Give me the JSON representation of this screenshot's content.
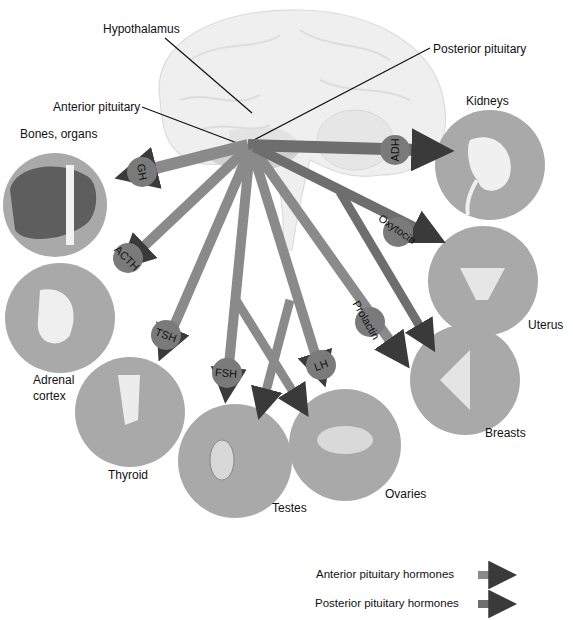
{
  "diagram": {
    "structures": {
      "hypothalamus": "Hypothalamus",
      "anterior_pituitary": "Anterior pituitary",
      "posterior_pituitary": "Posterior pituitary"
    },
    "targets": {
      "bones_organs": "Bones, organs",
      "kidneys": "Kidneys",
      "adrenal_line1": "Adrenal",
      "adrenal_line2": "cortex",
      "uterus": "Uterus",
      "thyroid": "Thyroid",
      "breasts": "Breasts",
      "testes": "Testes",
      "ovaries": "Ovaries"
    },
    "hormones": {
      "gh": "GH",
      "acth": "ACTH",
      "tsh": "TSH",
      "fsh": "FSH",
      "lh": "LH",
      "prolactin": "Prolactin",
      "oxytocin": "Oxytocin",
      "adh": "ADH"
    },
    "legend": {
      "anterior": "Anterior pituitary hormones",
      "posterior": "Posterior pituitary hormones"
    },
    "colors": {
      "anterior_shaft": "#8a8a8a",
      "anterior_head": "#3c3c3c",
      "posterior_shaft": "#6e6e6e",
      "posterior_head": "#333333",
      "badge": "#7a7a7a",
      "target_circle": "#a9a9a9",
      "brain": "#efefef"
    }
  }
}
